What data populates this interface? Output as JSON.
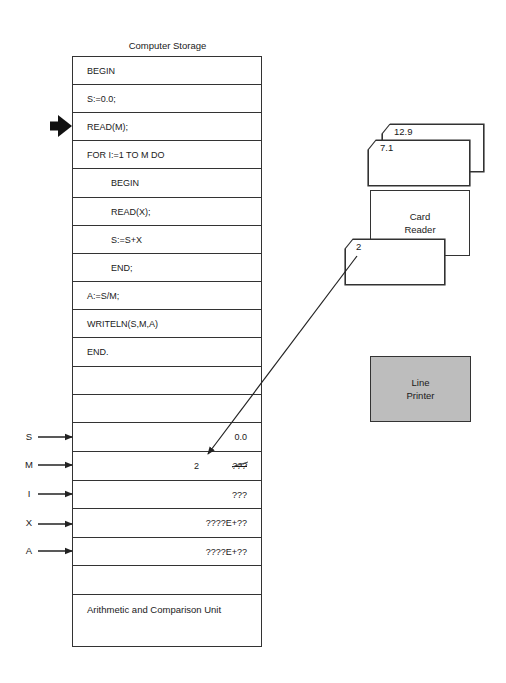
{
  "storage": {
    "title": "Computer Storage",
    "program_rows": [
      {
        "text": "BEGIN",
        "indent": 0
      },
      {
        "text": "S:=0.0;",
        "indent": 0
      },
      {
        "text": "READ(M);",
        "indent": 0
      },
      {
        "text": "FOR I:=1 TO M DO",
        "indent": 0
      },
      {
        "text": "BEGIN",
        "indent": 1
      },
      {
        "text": "READ(X);",
        "indent": 1
      },
      {
        "text": "S:=S+X",
        "indent": 1
      },
      {
        "text": "END;",
        "indent": 1
      },
      {
        "text": "A:=S/M;",
        "indent": 0
      },
      {
        "text": "WRITELN(S,M,A)",
        "indent": 0
      },
      {
        "text": "END.",
        "indent": 0
      },
      {
        "text": "",
        "indent": 0
      },
      {
        "text": "",
        "indent": 0
      }
    ],
    "current_instruction_index": 2,
    "current_instruction_pointer": "thick-right-arrow",
    "variables": [
      {
        "name": "S",
        "value": "0.0",
        "new_value": "",
        "struck": false
      },
      {
        "name": "M",
        "value": "???",
        "new_value": "2",
        "struck": true
      },
      {
        "name": "I",
        "value": "???",
        "new_value": "",
        "struck": false
      },
      {
        "name": "X",
        "value": "????E+??",
        "new_value": "",
        "struck": false
      },
      {
        "name": "A",
        "value": "????E+??",
        "new_value": "",
        "struck": false
      }
    ],
    "empty_rows_after_variables": 1,
    "alu_label": "Arithmetic and Comparison Unit"
  },
  "card_reader": {
    "label_line1": "Card",
    "label_line2": "Reader",
    "input_cards": [
      "12.9",
      "7.1"
    ],
    "read_card": "2"
  },
  "line_printer": {
    "label_line1": "Line",
    "label_line2": "Printer",
    "fill_color": "#bdbdbd"
  },
  "data_flow": {
    "from": "card 2",
    "to": "variable M"
  }
}
